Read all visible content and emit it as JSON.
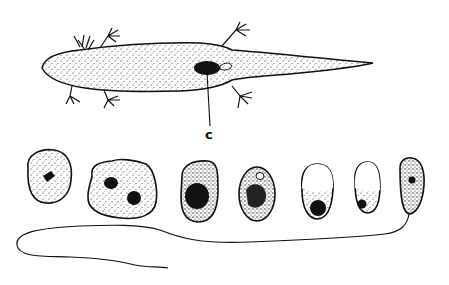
{
  "figure": {
    "labels": {
      "c": "c"
    },
    "colors": {
      "ink": "#111111",
      "background": "#ffffff"
    },
    "cells": [
      {
        "shape": "round",
        "nuclei": 1
      },
      {
        "shape": "irregular",
        "nuclei": 2
      },
      {
        "shape": "oval-dark",
        "nuclei": 1
      },
      {
        "shape": "oval",
        "nuclei": 1
      },
      {
        "shape": "oval-vacuole",
        "nuclei": 1
      },
      {
        "shape": "oval-vacuole",
        "nuclei": 1
      },
      {
        "shape": "elongated-flagellate",
        "nuclei": 1
      }
    ]
  }
}
